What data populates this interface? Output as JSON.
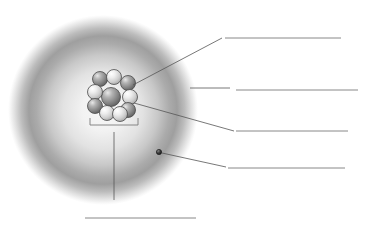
{
  "diagram": {
    "background_color": "#ffffff",
    "line_color": "#7a7a7a",
    "leader_color": "#555555",
    "electron_cloud": {
      "name": "electron cloud",
      "center_x": 103,
      "center_y": 110,
      "radius": 95,
      "ring_color": "#9a9a9a",
      "center_color": "#f4f4f4",
      "edge_color": "#ffffff"
    },
    "nucleus": {
      "name": "nucleus",
      "center_x": 111,
      "center_y": 96,
      "radius": 24,
      "particle_count": 10,
      "dark_particle_color": "#8e8e8e",
      "light_particle_color": "#d8d8d8",
      "outline_color": "#4a4a4a",
      "particles": [
        {
          "cx": 111,
          "cy": 97,
          "r": 9.5,
          "shade": "dark"
        },
        {
          "cx": 100,
          "cy": 79,
          "r": 7.5,
          "shade": "dark"
        },
        {
          "cx": 114,
          "cy": 77,
          "r": 7.5,
          "shade": "light"
        },
        {
          "cx": 128,
          "cy": 83,
          "r": 7.5,
          "shade": "dark"
        },
        {
          "cx": 95,
          "cy": 92,
          "r": 7.5,
          "shade": "light"
        },
        {
          "cx": 130,
          "cy": 97,
          "r": 7.5,
          "shade": "light"
        },
        {
          "cx": 95,
          "cy": 106,
          "r": 7.5,
          "shade": "dark"
        },
        {
          "cx": 128,
          "cy": 110,
          "r": 7.5,
          "shade": "dark"
        },
        {
          "cx": 107,
          "cy": 113,
          "r": 7.5,
          "shade": "light"
        },
        {
          "cx": 120,
          "cy": 114,
          "r": 7.5,
          "shade": "light"
        }
      ]
    },
    "electron": {
      "name": "electron",
      "cx": 159,
      "cy": 152,
      "r": 2.6,
      "fill_color": "#333333"
    },
    "bracket": {
      "name": "nucleus bracket",
      "left_x": 90,
      "right_x": 138,
      "bar_y": 125,
      "tick_height": 7,
      "stem_x": 114,
      "stem_bottom_y": 200
    },
    "leaders": [
      {
        "name": "leader-to-answer-1",
        "x1": 133,
        "y1": 85,
        "x2": 222,
        "y2": 38
      },
      {
        "name": "leader-to-answer-2",
        "x1": 190,
        "y1": 88,
        "x2": 230,
        "y2": 88
      },
      {
        "name": "leader-to-answer-3",
        "x1": 134,
        "y1": 103,
        "x2": 234,
        "y2": 131
      },
      {
        "name": "leader-to-answer-4",
        "x1": 162,
        "y1": 153,
        "x2": 226,
        "y2": 167
      },
      {
        "name": "leader-to-answer-5",
        "x1": 114,
        "y1": 132,
        "x2": 114,
        "y2": 200
      }
    ],
    "answer_lines": [
      {
        "id": 1,
        "label": "",
        "x1": 225,
        "x2": 341,
        "y": 38
      },
      {
        "id": 2,
        "label": "",
        "x1": 236,
        "x2": 358,
        "y": 90
      },
      {
        "id": 3,
        "label": "",
        "x1": 236,
        "x2": 348,
        "y": 131
      },
      {
        "id": 4,
        "label": "",
        "x1": 228,
        "x2": 345,
        "y": 168
      },
      {
        "id": 5,
        "label": "",
        "x1": 85,
        "x2": 196,
        "y": 218
      }
    ]
  }
}
